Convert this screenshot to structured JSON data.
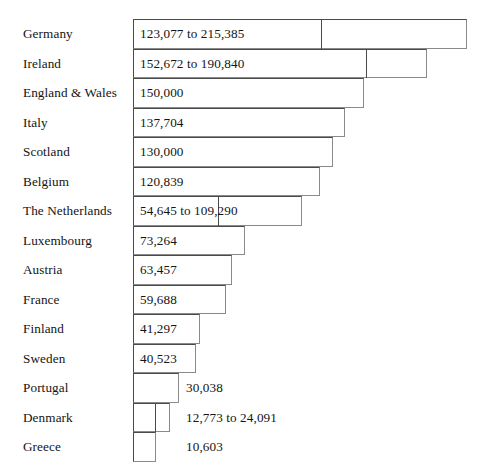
{
  "chart_data": {
    "type": "bar",
    "title": "",
    "subtitle": "",
    "xlabel": "",
    "ylabel": "",
    "orientation": "horizontal",
    "grid": false,
    "legend": null,
    "axis_visible": false,
    "tick_labels": [],
    "xlim": [
      0,
      215385
    ],
    "categories": [
      "Germany",
      "Ireland",
      "England & Wales",
      "Italy",
      "Scotland",
      "Belgium",
      "The Netherlands",
      "Luxembourg",
      "Austria",
      "France",
      "Finland",
      "Sweden",
      "Portugal",
      "Denmark",
      "Greece"
    ],
    "values": [
      215385,
      190840,
      150000,
      137704,
      130000,
      120839,
      109290,
      73264,
      63457,
      59688,
      41297,
      40523,
      30038,
      24091,
      10603
    ],
    "range_low": [
      123077,
      152672,
      null,
      null,
      null,
      null,
      54645,
      null,
      null,
      null,
      null,
      null,
      null,
      12773,
      null
    ],
    "annotations": [
      "123,077 to 215,385",
      "152,672 to 190,840",
      "150,000",
      "137,704",
      "130,000",
      "120,839",
      "54,645 to 109,290",
      "73,264",
      "63,457",
      "59,688",
      "41,297",
      "40,523",
      "30,038",
      "12,773 to 24,091",
      "10,603"
    ],
    "rows": [
      {
        "label": "Germany",
        "value_text": "123,077 to 215,385",
        "label_outside": false,
        "bar_left": 133,
        "bar_right": 467,
        "divider_x": 321
      },
      {
        "label": "Ireland",
        "value_text": "152,672 to 190,840",
        "label_outside": false,
        "bar_left": 133,
        "bar_right": 427,
        "divider_x": 366
      },
      {
        "label": "England & Wales",
        "value_text": "150,000",
        "label_outside": false,
        "bar_left": 133,
        "bar_right": 364,
        "divider_x": null
      },
      {
        "label": "Italy",
        "value_text": "137,704",
        "label_outside": false,
        "bar_left": 133,
        "bar_right": 345,
        "divider_x": null
      },
      {
        "label": "Scotland",
        "value_text": "130,000",
        "label_outside": false,
        "bar_left": 133,
        "bar_right": 333,
        "divider_x": null
      },
      {
        "label": "Belgium",
        "value_text": "120,839",
        "label_outside": false,
        "bar_left": 133,
        "bar_right": 320,
        "divider_x": null
      },
      {
        "label": "The Netherlands",
        "value_text": "54,645 to 109,290",
        "label_outside": false,
        "bar_left": 133,
        "bar_right": 302,
        "divider_x": 218
      },
      {
        "label": "Luxembourg",
        "value_text": "73,264",
        "label_outside": false,
        "bar_left": 133,
        "bar_right": 245,
        "divider_x": null
      },
      {
        "label": "Austria",
        "value_text": "63,457",
        "label_outside": false,
        "bar_left": 133,
        "bar_right": 232,
        "divider_x": null
      },
      {
        "label": "France",
        "value_text": "59,688",
        "label_outside": false,
        "bar_left": 133,
        "bar_right": 226,
        "divider_x": null
      },
      {
        "label": "Finland",
        "value_text": "41,297",
        "label_outside": false,
        "bar_left": 133,
        "bar_right": 200,
        "divider_x": null
      },
      {
        "label": "Sweden",
        "value_text": "40,523",
        "label_outside": false,
        "bar_left": 133,
        "bar_right": 196,
        "divider_x": null
      },
      {
        "label": "Portugal",
        "value_text": "30,038",
        "label_outside": true,
        "bar_left": 133,
        "bar_right": 179,
        "divider_x": null
      },
      {
        "label": "Denmark",
        "value_text": "12,773 to 24,091",
        "label_outside": true,
        "bar_left": 133,
        "bar_right": 170,
        "divider_x": 155
      },
      {
        "label": "Greece",
        "value_text": "10,603",
        "label_outside": true,
        "bar_left": 133,
        "bar_right": 156,
        "divider_x": null
      }
    ]
  },
  "layout": {
    "chart_top": 19,
    "row_height": 29.5,
    "label_x": 23,
    "value_inside_pad": 7,
    "value_outside_x": 186
  }
}
